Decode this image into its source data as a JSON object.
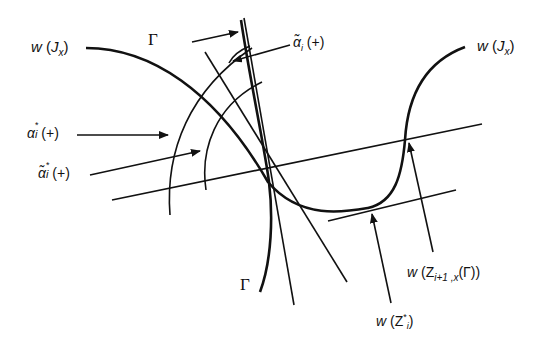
{
  "figure": {
    "type": "geometric-diagram",
    "labels": {
      "w_jx_left": "w (Jx)",
      "w_jx_right": "w (Jx)",
      "gamma_top": "Γ",
      "gamma_bottom": "Γ",
      "alpha_star_plus": "α*ᵢ (+)",
      "alpha_tilde_star_plus": "α̃*ᵢ (+)",
      "alpha_tilde_i_plus": "α̃ᵢ (+)",
      "w_z_next": "w (Zᵢ₊₁,ₓ(Γ))",
      "w_z_star": "w (Z*ᵢ)"
    },
    "parts": {
      "w_left": {
        "main": "w",
        "open": " (",
        "sym": "J",
        "sub": "x",
        "close": ")"
      },
      "w_right": {
        "main": "w",
        "open": " (",
        "sym": "J",
        "sub": "x",
        "close": ")"
      },
      "alpha_star": {
        "sym": "α",
        "sup": "*",
        "sub": "i",
        "rest": " (+)"
      },
      "alpha_tilde_star": {
        "sym": "α̃",
        "sup": "*",
        "sub": "i",
        "rest": " (+)"
      },
      "alpha_tilde_i": {
        "sym": "α̃",
        "sub": "i",
        "rest": " (+)"
      },
      "w_znext": {
        "main": "w",
        "open": " (Z",
        "sub": "i+1 ,x",
        "rest": "(Γ))"
      },
      "w_zstar": {
        "main": "w",
        "open": " (Z",
        "sup": "*",
        "sub": "i",
        "close": ")"
      }
    },
    "colors": {
      "stroke": "#111111",
      "background": "#ffffff"
    }
  }
}
